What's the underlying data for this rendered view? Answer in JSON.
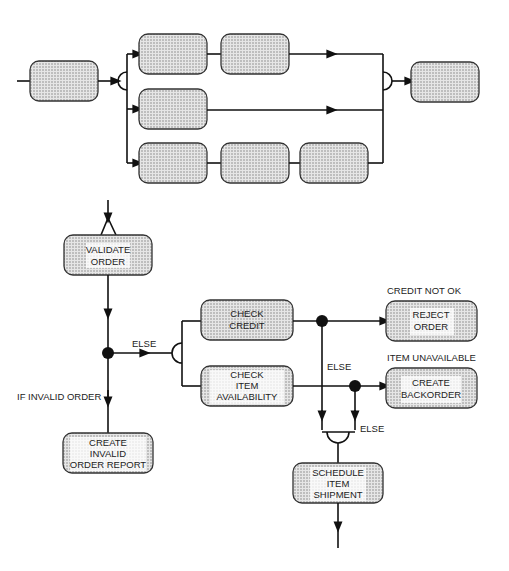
{
  "top_diagram": {
    "description": "Generic parallel process schematic with unlabeled boxes",
    "boxes": [
      "",
      "",
      "",
      "",
      "",
      "",
      "",
      ""
    ]
  },
  "bottom_diagram": {
    "nodes": {
      "validate_order": [
        "VALIDATE",
        "ORDER"
      ],
      "check_credit": [
        "CHECK",
        "CREDIT"
      ],
      "check_item": [
        "CHECK",
        "ITEM",
        "AVAILABILITY"
      ],
      "reject_order": [
        "REJECT",
        "ORDER"
      ],
      "create_backorder": [
        "CREATE",
        "BACKORDER"
      ],
      "create_invalid": [
        "CREATE",
        "INVALID",
        "ORDER REPORT"
      ],
      "schedule_shipment": [
        "SCHEDULE",
        "ITEM",
        "SHIPMENT"
      ]
    },
    "labels": {
      "else_main": "ELSE",
      "if_invalid": "IF INVALID ORDER",
      "credit_not_ok": "CREDIT NOT OK",
      "item_unavailable": "ITEM UNAVAILABLE",
      "else_credit": "ELSE",
      "else_item": "ELSE"
    }
  },
  "colors": {
    "line": "#111111",
    "box_fill": "#d8d8d8",
    "box_stroke": "#333333"
  }
}
